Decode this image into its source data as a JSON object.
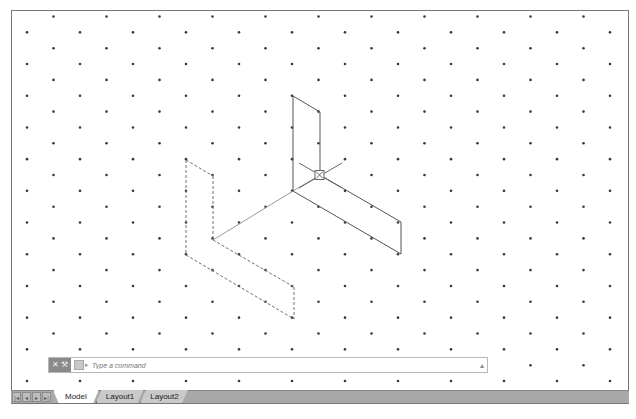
{
  "viewport": {
    "grid": {
      "type": "isometric-snap-dots",
      "row_spacing_px": 16,
      "col_spacing_px": 53,
      "dot_color": "#3a3a3a"
    },
    "drawing": {
      "solid_color": "#555555",
      "dashed_color": "#707070",
      "solid_light_color": "#9a9a9a"
    },
    "cursor": {
      "type": "crosshair-pickbox",
      "x": 319,
      "y": 174
    }
  },
  "command_line": {
    "close_icon": "close-icon",
    "settings_icon": "wrench-icon",
    "prompt_icon": "command-prompt-icon",
    "placeholder": "Type a command",
    "dropdown_icon": "chevron-up-icon"
  },
  "tabs": {
    "nav_buttons": [
      {
        "icon": "first-tab-icon",
        "glyph": "|◂"
      },
      {
        "icon": "prev-tab-icon",
        "glyph": "◂"
      },
      {
        "icon": "next-tab-icon",
        "glyph": "▸"
      },
      {
        "icon": "last-tab-icon",
        "glyph": "▸|"
      }
    ],
    "items": [
      {
        "label": "Model",
        "active": true
      },
      {
        "label": "Layout1",
        "active": false
      },
      {
        "label": "Layout2",
        "active": false
      }
    ]
  }
}
